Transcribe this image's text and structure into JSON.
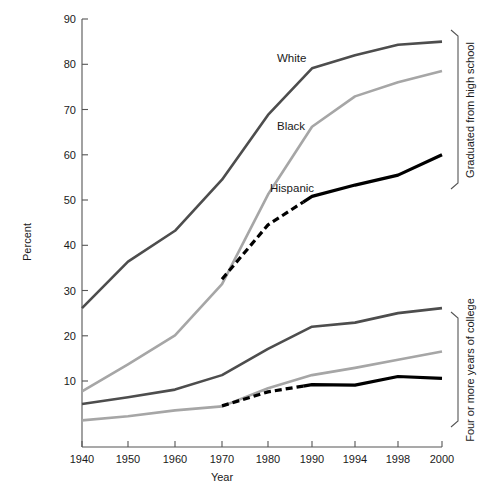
{
  "chart_data": {
    "type": "line",
    "title": "",
    "xlabel": "Year",
    "ylabel": "Percent",
    "xlim": [
      1940,
      2000
    ],
    "ylim": [
      0,
      90
    ],
    "grid": false,
    "legend_position": "inline-right-brackets",
    "x_ticks": [
      1940,
      1950,
      1960,
      1970,
      1980,
      1990,
      1994,
      1998,
      2000
    ],
    "x_tick_labels": [
      "1940",
      "1950",
      "1960",
      "1970",
      "1980",
      "1990",
      "1994",
      "1998",
      "2000"
    ],
    "y_ticks": [
      10,
      20,
      30,
      40,
      50,
      60,
      70,
      80,
      90
    ],
    "y_tick_labels": [
      "10",
      "20",
      "30",
      "40",
      "50",
      "60",
      "70",
      "80",
      "90"
    ],
    "groups": [
      {
        "name": "graduated-high-school",
        "label": "Graduated from high school",
        "series": [
          {
            "name": "White",
            "label": "White",
            "color": "#4d4d4d",
            "style": "solid",
            "x": [
              1940,
              1950,
              1960,
              1970,
              1980,
              1990,
              1994,
              1998,
              2000
            ],
            "values": [
              26.1,
              36.4,
              43.2,
              54.5,
              68.8,
              79.1,
              82.0,
              84.3,
              85.0
            ]
          },
          {
            "name": "Black",
            "label": "Black",
            "color": "#a6a6a6",
            "style": "solid",
            "x": [
              1940,
              1950,
              1960,
              1970,
              1980,
              1990,
              1994,
              1998,
              2000
            ],
            "values": [
              7.7,
              13.7,
              20.1,
              31.4,
              51.2,
              66.2,
              72.9,
              76.0,
              78.5
            ]
          },
          {
            "name": "Hispanic",
            "label": "Hispanic",
            "color": "#000000",
            "style": "dashed-then-solid",
            "x": [
              1970,
              1980,
              1990,
              1994,
              1998,
              2000
            ],
            "values": [
              32.5,
              44.5,
              50.8,
              53.3,
              55.5,
              60.0
            ]
          }
        ]
      },
      {
        "name": "four-or-more-years-college",
        "label": "Four or more years of college",
        "series": [
          {
            "name": "White-college",
            "label": "White",
            "color": "#4d4d4d",
            "style": "solid",
            "x": [
              1940,
              1950,
              1960,
              1970,
              1980,
              1990,
              1994,
              1998,
              2000
            ],
            "values": [
              4.9,
              6.4,
              8.1,
              11.3,
              17.1,
              22.0,
              22.9,
              25.0,
              26.1
            ]
          },
          {
            "name": "Black-college",
            "label": "Black",
            "color": "#a6a6a6",
            "style": "solid",
            "x": [
              1940,
              1950,
              1960,
              1970,
              1980,
              1990,
              1994,
              1998,
              2000
            ],
            "values": [
              1.3,
              2.2,
              3.5,
              4.4,
              8.4,
              11.3,
              12.9,
              14.7,
              16.5
            ]
          },
          {
            "name": "Hispanic-college",
            "label": "Hispanic",
            "color": "#000000",
            "style": "dashed-then-solid",
            "x": [
              1970,
              1980,
              1990,
              1994,
              1998,
              2000
            ],
            "values": [
              4.5,
              7.6,
              9.2,
              9.1,
              11.0,
              10.6
            ]
          }
        ]
      }
    ],
    "inline_labels": [
      {
        "name": "label-white",
        "text": "White"
      },
      {
        "name": "label-black",
        "text": "Black"
      },
      {
        "name": "label-hispanic",
        "text": "Hispanic"
      }
    ],
    "bracket_labels": [
      {
        "name": "bracket-high-school",
        "text": "Graduated from high school"
      },
      {
        "name": "bracket-college",
        "text": "Four or more years of college"
      }
    ]
  }
}
